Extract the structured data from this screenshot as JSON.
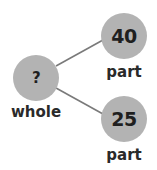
{
  "diagram": {
    "type": "part-whole model",
    "colors": {
      "circle": "#b3b3b3",
      "line": "#7a7a7a",
      "text": "#1f1f1f"
    },
    "whole": {
      "value": "?",
      "label": "whole"
    },
    "parts": [
      {
        "value": "40",
        "label": "part"
      },
      {
        "value": "25",
        "label": "part"
      }
    ]
  }
}
